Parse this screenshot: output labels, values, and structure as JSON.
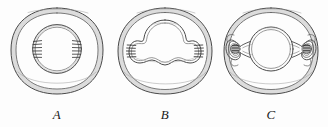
{
  "figure": {
    "kind": "scientific-line-engraving",
    "background_color": "#fdfdfd",
    "ink_color": "#3a3a3a",
    "wall_fill_color": "#d9d9d9",
    "panel_count": 3,
    "panels": [
      {
        "label": "A",
        "description": "outer rounded-square wall ring enclosing a single inner circle with short hatch marks at left and right",
        "inner_forms": 1,
        "hatch_sites": 2
      },
      {
        "label": "B",
        "description": "outer oval wall ring enclosing a lobed cloud-like inner mass with a central dome and two side lobes, hatch marks at left and right edges",
        "inner_forms": 1,
        "hatch_sites": 2
      },
      {
        "label": "C",
        "description": "outer oval wall ring enclosing a central circle flanked by two small spiral nodules with hatching, joined by narrow necks",
        "inner_forms": 3,
        "hatch_sites": 2
      }
    ]
  }
}
